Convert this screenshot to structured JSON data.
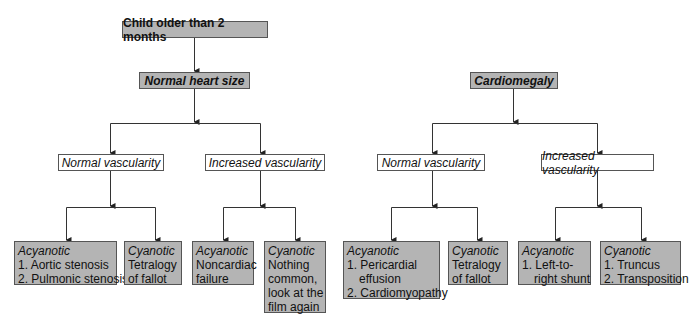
{
  "root": {
    "label": "Child older than 2 months"
  },
  "branches": [
    {
      "label": "Normal heart size",
      "children": [
        {
          "label": "Normal vascularity",
          "leaves": [
            {
              "type": "Acyanotic",
              "lines": [
                "1. Aortic stenosis",
                "2. Pulmonic stenosis"
              ]
            },
            {
              "type": "Cyanotic",
              "lines": [
                "Tetralogy",
                "of fallot"
              ]
            }
          ]
        },
        {
          "label": "Increased vascularity",
          "leaves": [
            {
              "type": "Acyanotic",
              "lines": [
                "Noncardiac",
                "failure"
              ]
            },
            {
              "type": "Cyanotic",
              "lines": [
                "Nothing",
                "common,",
                "look at the",
                "film again"
              ]
            }
          ]
        }
      ]
    },
    {
      "label": "Cardiomegaly",
      "children": [
        {
          "label": "Normal vascularity",
          "leaves": [
            {
              "type": "Acyanotic",
              "lines": [
                "1. Pericardial",
                "effusion",
                "2. Cardiomyopathy"
              ]
            },
            {
              "type": "Cyanotic",
              "lines": [
                "Tetralogy",
                "of fallot"
              ]
            }
          ]
        },
        {
          "label": "Increased vascularity",
          "leaves": [
            {
              "type": "Acyanotic",
              "lines": [
                "1. Left-to-",
                "right shunt"
              ]
            },
            {
              "type": "Cyanotic",
              "lines": [
                "1. Truncus",
                "2. Transposition"
              ]
            }
          ]
        }
      ]
    }
  ],
  "colors": {
    "box_fill": "#b4b4b4",
    "border": "#555555",
    "line": "#333333"
  }
}
